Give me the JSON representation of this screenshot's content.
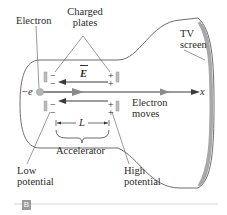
{
  "figure": {
    "panel_tag": "B",
    "labels": {
      "electron": "Electron",
      "charged_plates_line1": "Charged",
      "charged_plates_line2": "plates",
      "tv_screen_line1": "TV",
      "tv_screen_line2": "screen",
      "electron_moves_line1": "Electron",
      "electron_moves_line2": "moves",
      "accelerator": "Accelerator",
      "low_potential_line1": "Low",
      "low_potential_line2": "potential",
      "high_potential_line1": "High",
      "high_potential_line2": "potential",
      "charge": "−e",
      "field": "E",
      "length": "L",
      "axis": "x"
    },
    "plate_signs": {
      "left": "−",
      "right": "+"
    },
    "colors": {
      "tube_outline": "#6e6e6e",
      "screen": "#a8a8a8",
      "arrow": "#3a3a3a",
      "plate": "#bdbdbd",
      "electron": "#b5b5b5",
      "divider": "#c8c8c8"
    }
  }
}
